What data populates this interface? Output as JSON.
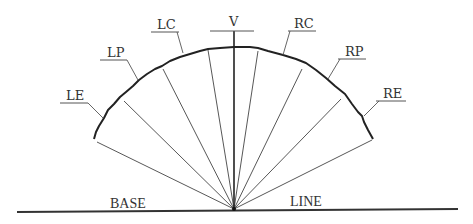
{
  "diagram": {
    "type": "fan-arc diagram",
    "apex": {
      "x": 234,
      "y": 209
    },
    "baseline": {
      "left_label": "BASE",
      "right_label": "LINE"
    },
    "vertex_label": "V",
    "points": [
      {
        "id": "LE",
        "label": "LE",
        "side": "left"
      },
      {
        "id": "LP",
        "label": "LP",
        "side": "left"
      },
      {
        "id": "LC",
        "label": "LC",
        "side": "left"
      },
      {
        "id": "V",
        "label": "V",
        "side": "center"
      },
      {
        "id": "RC",
        "label": "RC",
        "side": "right"
      },
      {
        "id": "RP",
        "label": "RP",
        "side": "right"
      },
      {
        "id": "RE",
        "label": "RE",
        "side": "right"
      }
    ],
    "ray_count": 9,
    "colors": {
      "line": "#333333",
      "background": "#ffffff"
    }
  }
}
